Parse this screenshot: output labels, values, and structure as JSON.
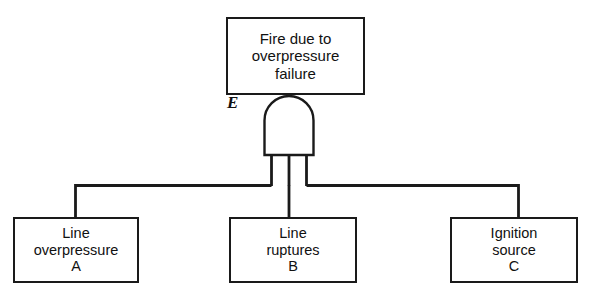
{
  "diagram": {
    "type": "fault-tree",
    "background_color": "#ffffff",
    "line_color": "#1a1a1a"
  },
  "top_event": {
    "id": "E",
    "gate_label": "E",
    "gate_type": "AND",
    "lines": [
      "Fire due to",
      "overpressure",
      "failure"
    ]
  },
  "basic_events": [
    {
      "id": "A",
      "lines": [
        "Line",
        "overpressure",
        "A"
      ]
    },
    {
      "id": "B",
      "lines": [
        "Line",
        "ruptures",
        "B"
      ]
    },
    {
      "id": "C",
      "lines": [
        "Ignition",
        "source",
        "C"
      ]
    }
  ]
}
